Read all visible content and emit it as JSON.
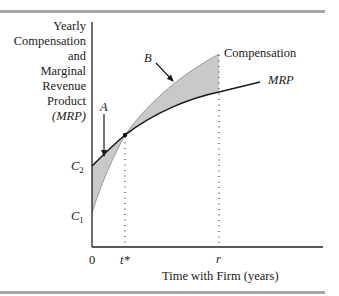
{
  "figure": {
    "y_axis_label_lines": [
      "Yearly",
      "Compensation",
      "and",
      "Marginal",
      "Revenue",
      "Product",
      "(MRP)"
    ],
    "x_axis_label": "Time with Firm (years)",
    "x_ticks": {
      "origin": "0",
      "t_star": "t*",
      "r": "r"
    },
    "y_ticks": {
      "c2": "C",
      "c2_sub": "2",
      "c1": "C",
      "c1_sub": "1"
    },
    "curve_labels": {
      "compensation": "Compensation",
      "mrp": "MRP"
    },
    "region_labels": {
      "a": "A",
      "b": "B"
    },
    "colors": {
      "shade": "#c9c9c9",
      "line": "#1a1a1a",
      "rule": "#a8a8a8"
    }
  }
}
